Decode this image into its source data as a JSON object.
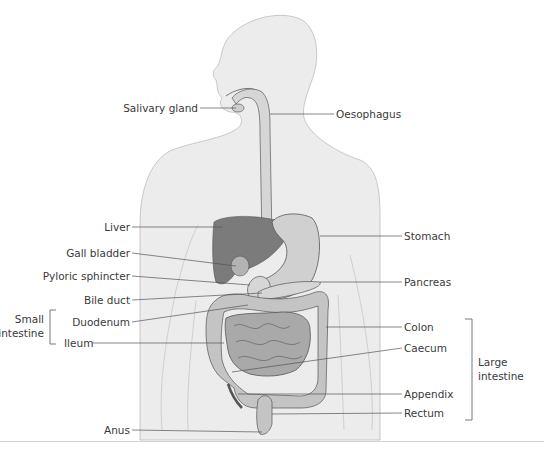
{
  "diagram": {
    "type": "human digestive system",
    "colors": {
      "body": "#ececec",
      "body_outline": "#bdbdbd",
      "liver": "#7b7b7b",
      "organ_light": "#cfcfcf",
      "intestine": "#a9a9a9",
      "colon": "#c4c4c4",
      "leader": "#555555",
      "text": "#3a3a3a"
    },
    "labels_left": [
      {
        "id": "salivary-gland",
        "text": "Salivary gland"
      },
      {
        "id": "liver",
        "text": "Liver"
      },
      {
        "id": "gall-bladder",
        "text": "Gall bladder"
      },
      {
        "id": "pyloric-sphincter",
        "text": "Pyloric sphincter"
      },
      {
        "id": "bile-duct",
        "text": "Bile duct"
      },
      {
        "id": "duodenum",
        "text": "Duodenum"
      },
      {
        "id": "ileum",
        "text": "Ileum"
      },
      {
        "id": "anus",
        "text": "Anus"
      }
    ],
    "labels_right": [
      {
        "id": "oesophagus",
        "text": "Oesophagus"
      },
      {
        "id": "stomach",
        "text": "Stomach"
      },
      {
        "id": "pancreas",
        "text": "Pancreas"
      },
      {
        "id": "colon",
        "text": "Colon"
      },
      {
        "id": "caecum",
        "text": "Caecum"
      },
      {
        "id": "appendix",
        "text": "Appendix"
      },
      {
        "id": "rectum",
        "text": "Rectum"
      }
    ],
    "groups": {
      "small_intestine": {
        "line1": "Small",
        "line2": "intestine"
      },
      "large_intestine": {
        "line1": "Large",
        "line2": "intestine"
      }
    }
  }
}
